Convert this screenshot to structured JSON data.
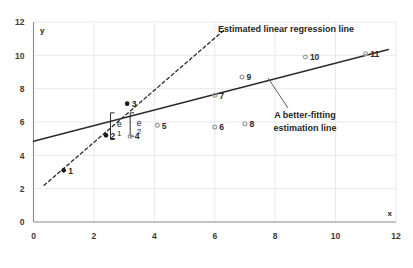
{
  "chart_data": {
    "type": "scatter",
    "title": "",
    "xlabel": "x",
    "ylabel": "y",
    "xlim": [
      0,
      12
    ],
    "ylim": [
      0,
      12
    ],
    "xticks": [
      0,
      2,
      4,
      6,
      8,
      10,
      12
    ],
    "yticks": [
      0,
      2,
      4,
      6,
      8,
      10,
      12
    ],
    "grid": true,
    "legend": "none",
    "points": [
      {
        "label": "1",
        "x": 1.0,
        "y": 3.1,
        "style": "filled"
      },
      {
        "label": "2",
        "x": 2.4,
        "y": 5.2,
        "style": "filled"
      },
      {
        "label": "3",
        "x": 3.1,
        "y": 7.1,
        "style": "filled"
      },
      {
        "label": "4",
        "x": 3.2,
        "y": 5.15,
        "style": "open"
      },
      {
        "label": "5",
        "x": 4.1,
        "y": 5.8,
        "style": "open"
      },
      {
        "label": "6",
        "x": 6.0,
        "y": 5.7,
        "style": "open"
      },
      {
        "label": "7",
        "x": 6.0,
        "y": 7.6,
        "style": "open"
      },
      {
        "label": "8",
        "x": 7.0,
        "y": 5.9,
        "style": "open"
      },
      {
        "label": "9",
        "x": 6.9,
        "y": 8.7,
        "style": "open"
      },
      {
        "label": "10",
        "x": 9.0,
        "y": 9.9,
        "style": "open"
      },
      {
        "label": "11",
        "x": 11.0,
        "y": 10.1,
        "style": "open"
      }
    ],
    "lines": [
      {
        "name": "estimated-linear-regression-line",
        "style": "dashed",
        "label": "Estimated linear regression line",
        "x1": 0.35,
        "y1": 2.2,
        "x2": 6.3,
        "y2": 11.5
      },
      {
        "name": "better-fitting-estimation-line",
        "style": "solid",
        "label": "A better-fitting estimation line",
        "x1": 0.0,
        "y1": 4.85,
        "x2": 11.75,
        "y2": 10.35
      }
    ],
    "annotations": [
      {
        "name": "regression-line-label",
        "text": "Estimated linear regression line"
      },
      {
        "name": "better-fit-line-label-1",
        "text": "A better-fitting"
      },
      {
        "name": "better-fit-line-label-2",
        "text": "estimation line"
      }
    ],
    "residuals": [
      {
        "name": "residual-e1",
        "letter": "e",
        "subscript": "1",
        "x": 2.55,
        "y_top": 6.55,
        "y_bottom": 4.95
      },
      {
        "name": "residual-e2",
        "letter": "e",
        "subscript": "2",
        "x": 3.2,
        "y_top": 6.55,
        "y_bottom": 5.15
      }
    ]
  },
  "axis": {
    "x_name": "x",
    "y_name": "y",
    "x_tick_labels": [
      "0",
      "2",
      "4",
      "6",
      "8",
      "10",
      "12"
    ],
    "y_tick_labels": [
      "0",
      "2",
      "4",
      "6",
      "8",
      "10",
      "12"
    ]
  },
  "colors": {
    "background": "#ffffff",
    "axis": "#8a8a8a",
    "grid": "#e8e8ee",
    "line": "#2b2b2b",
    "marker_filled": "#1a1a1a",
    "marker_open": "#9a9a9a",
    "text": "#2b2b2b"
  }
}
